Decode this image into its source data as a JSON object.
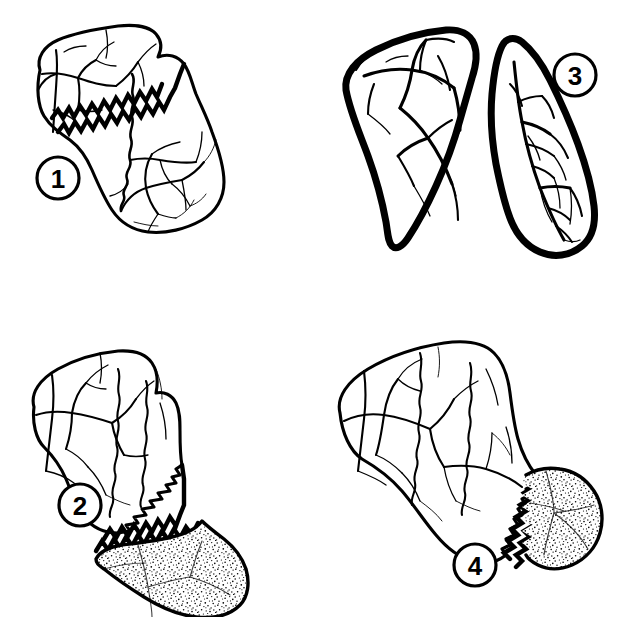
{
  "figure": {
    "background_color": "#ffffff",
    "ink_color": "#000000",
    "panel_count": 4,
    "layout": "2x2 grid",
    "media": "scanned black and white line drawing"
  },
  "panels": [
    {
      "id": "panel-1",
      "label": "1",
      "label_position": "lower-left",
      "grid_cell": "top-left",
      "description": "Complete bone in outline with jagged sutural margin and branching vascular grooves; no shading",
      "features": [
        "outline",
        "zigzag suture",
        "wavy suture",
        "vascular grooves"
      ],
      "stippled": "no"
    },
    {
      "id": "panel-2",
      "label": "2",
      "label_position": "lower-left",
      "grid_cell": "bottom-left",
      "description": "Bone with the large lower-right portion rendered in dense stipple, separated by a jagged suture",
      "features": [
        "outline",
        "zigzag suture",
        "vascular grooves",
        "large stippled region"
      ],
      "stippled": "yes"
    },
    {
      "id": "panel-3",
      "label": "3",
      "label_position": "upper-right",
      "grid_cell": "top-right",
      "description": "Bone split into two separate fragments drawn with heavy black outlines and dense vascular markings",
      "features": [
        "two separate fragments",
        "heavy outline",
        "dense vascular grooves"
      ],
      "stippled": "no"
    },
    {
      "id": "panel-4",
      "label": "4",
      "label_position": "bottom-center",
      "grid_cell": "bottom-right",
      "description": "Bone with a smaller stippled wedge at the right end, separated by a jagged suture",
      "features": [
        "outline",
        "zigzag suture",
        "vascular grooves",
        "small stippled region"
      ],
      "stippled": "yes"
    }
  ],
  "labels": {
    "one": "1",
    "two": "2",
    "three": "3",
    "four": "4"
  },
  "colors": {
    "ink": "#000000",
    "paper": "#ffffff"
  }
}
